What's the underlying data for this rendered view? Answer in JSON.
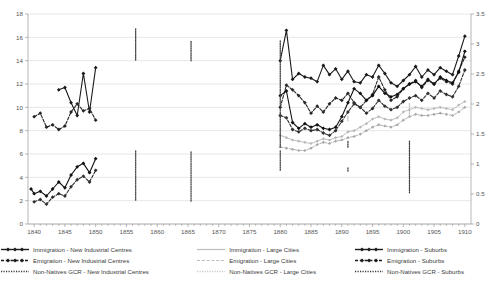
{
  "chart_data": {
    "type": "line",
    "title": "",
    "subtitle": "",
    "xlabel": "",
    "ylabel": "",
    "y2label": "",
    "xlim": [
      1839,
      1911
    ],
    "ylim": [
      0,
      18
    ],
    "y2lim": [
      0,
      3.5
    ],
    "grid": true,
    "legend_position": "bottom",
    "x_ticks": [
      1840,
      1845,
      1850,
      1855,
      1860,
      1865,
      1870,
      1875,
      1880,
      1885,
      1890,
      1895,
      1900,
      1905,
      1910
    ],
    "y_ticks": [
      0,
      2,
      4,
      6,
      8,
      10,
      12,
      14,
      16,
      18
    ],
    "y2_ticks": [
      0,
      0.5,
      1,
      1.5,
      2,
      2.5,
      3,
      3.5
    ],
    "series": [
      {
        "name": "Immigration - New Industrial Centres",
        "axis": "left",
        "style": "solid-marker",
        "color": "#1a1a1a",
        "points": [
          [
            1844,
            11.5
          ],
          [
            1845,
            11.7
          ],
          [
            1846,
            10.4
          ],
          [
            1847,
            9.3
          ],
          [
            1848,
            12.9
          ],
          [
            1849,
            9.6
          ],
          [
            1850,
            13.4
          ],
          [
            1880,
            14.0
          ],
          [
            1881,
            16.6
          ],
          [
            1882,
            12.4
          ],
          [
            1883,
            12.9
          ],
          [
            1884,
            12.6
          ],
          [
            1885,
            12.5
          ],
          [
            1886,
            12.2
          ],
          [
            1887,
            13.6
          ],
          [
            1888,
            12.8
          ],
          [
            1889,
            13.3
          ],
          [
            1890,
            12.4
          ],
          [
            1891,
            13.1
          ],
          [
            1892,
            12.2
          ],
          [
            1893,
            12.1
          ],
          [
            1894,
            12.8
          ],
          [
            1895,
            12.6
          ],
          [
            1896,
            13.6
          ],
          [
            1897,
            12.9
          ],
          [
            1898,
            12.1
          ],
          [
            1899,
            11.8
          ],
          [
            1900,
            12.3
          ],
          [
            1901,
            12.8
          ],
          [
            1902,
            13.5
          ],
          [
            1903,
            12.6
          ],
          [
            1904,
            13.2
          ],
          [
            1905,
            12.8
          ],
          [
            1906,
            13.4
          ],
          [
            1907,
            13.1
          ],
          [
            1908,
            12.8
          ],
          [
            1909,
            14.4
          ],
          [
            1910,
            16.1
          ]
        ]
      },
      {
        "name": "Emigration - New Industrial Centres",
        "axis": "left",
        "style": "dashed-marker",
        "color": "#262626",
        "points": [
          [
            1840,
            9.2
          ],
          [
            1841,
            9.5
          ],
          [
            1842,
            8.3
          ],
          [
            1843,
            8.5
          ],
          [
            1844,
            8.1
          ],
          [
            1845,
            8.4
          ],
          [
            1846,
            9.6
          ],
          [
            1847,
            10.3
          ],
          [
            1848,
            9.7
          ],
          [
            1849,
            9.9
          ],
          [
            1850,
            8.9
          ],
          [
            1880,
            10.0
          ],
          [
            1881,
            11.9
          ],
          [
            1882,
            11.5
          ],
          [
            1883,
            11.0
          ],
          [
            1884,
            10.4
          ],
          [
            1885,
            9.5
          ],
          [
            1886,
            10.1
          ],
          [
            1887,
            9.6
          ],
          [
            1888,
            10.3
          ],
          [
            1889,
            10.8
          ],
          [
            1890,
            10.6
          ],
          [
            1891,
            11.2
          ],
          [
            1892,
            10.4
          ],
          [
            1893,
            10.0
          ],
          [
            1894,
            10.6
          ],
          [
            1895,
            11.1
          ],
          [
            1896,
            12.6
          ],
          [
            1897,
            11.5
          ],
          [
            1898,
            10.6
          ],
          [
            1899,
            10.9
          ],
          [
            1900,
            11.6
          ],
          [
            1901,
            12.0
          ],
          [
            1902,
            12.3
          ],
          [
            1903,
            11.7
          ],
          [
            1904,
            12.3
          ],
          [
            1905,
            12.0
          ],
          [
            1906,
            12.5
          ],
          [
            1907,
            12.2
          ],
          [
            1908,
            12.0
          ],
          [
            1909,
            13.1
          ],
          [
            1910,
            14.3
          ]
        ]
      },
      {
        "name": "Immigration - Large Cities",
        "axis": "left",
        "style": "solid-light",
        "color": "#b8b8b8",
        "points": [
          [
            1880,
            7.6
          ],
          [
            1881,
            7.4
          ],
          [
            1882,
            7.2
          ],
          [
            1883,
            7.1
          ],
          [
            1884,
            7.0
          ],
          [
            1885,
            6.9
          ],
          [
            1886,
            7.1
          ],
          [
            1887,
            7.3
          ],
          [
            1888,
            7.2
          ],
          [
            1889,
            7.4
          ],
          [
            1890,
            7.5
          ],
          [
            1891,
            7.9
          ],
          [
            1892,
            8.0
          ],
          [
            1893,
            8.3
          ],
          [
            1894,
            8.6
          ],
          [
            1895,
            9.0
          ],
          [
            1896,
            9.2
          ],
          [
            1897,
            9.0
          ],
          [
            1898,
            8.9
          ],
          [
            1899,
            9.1
          ],
          [
            1900,
            9.6
          ],
          [
            1901,
            9.8
          ],
          [
            1902,
            10.0
          ],
          [
            1903,
            9.9
          ],
          [
            1904,
            9.8
          ],
          [
            1905,
            9.9
          ],
          [
            1906,
            10.0
          ],
          [
            1907,
            9.9
          ],
          [
            1908,
            9.8
          ],
          [
            1909,
            10.2
          ],
          [
            1910,
            10.5
          ]
        ]
      },
      {
        "name": "Emigration - Large Cities",
        "axis": "left",
        "style": "dashed-light",
        "color": "#a8a8a8",
        "points": [
          [
            1880,
            6.6
          ],
          [
            1881,
            6.5
          ],
          [
            1882,
            6.4
          ],
          [
            1883,
            6.3
          ],
          [
            1884,
            6.3
          ],
          [
            1885,
            6.5
          ],
          [
            1886,
            6.8
          ],
          [
            1887,
            7.0
          ],
          [
            1888,
            6.9
          ],
          [
            1889,
            7.1
          ],
          [
            1890,
            7.2
          ],
          [
            1891,
            7.4
          ],
          [
            1892,
            7.5
          ],
          [
            1893,
            7.7
          ],
          [
            1894,
            8.0
          ],
          [
            1895,
            8.3
          ],
          [
            1896,
            8.5
          ],
          [
            1897,
            8.4
          ],
          [
            1898,
            8.3
          ],
          [
            1899,
            8.5
          ],
          [
            1900,
            8.9
          ],
          [
            1901,
            9.2
          ],
          [
            1902,
            9.4
          ],
          [
            1903,
            9.3
          ],
          [
            1904,
            9.3
          ],
          [
            1905,
            9.4
          ],
          [
            1906,
            9.5
          ],
          [
            1907,
            9.4
          ],
          [
            1908,
            9.3
          ],
          [
            1909,
            9.6
          ],
          [
            1910,
            10.0
          ]
        ]
      },
      {
        "name": "Immigration - Suburbs",
        "axis": "left",
        "style": "solid-marker",
        "color": "#111111",
        "points": [
          [
            1839.5,
            3.0
          ],
          [
            1840,
            2.6
          ],
          [
            1841,
            2.8
          ],
          [
            1842,
            2.4
          ],
          [
            1843,
            3.0
          ],
          [
            1844,
            3.6
          ],
          [
            1845,
            3.1
          ],
          [
            1846,
            4.2
          ],
          [
            1847,
            4.9
          ],
          [
            1848,
            5.2
          ],
          [
            1849,
            4.4
          ],
          [
            1850,
            5.6
          ],
          [
            1880,
            11.0
          ],
          [
            1881,
            11.4
          ],
          [
            1882,
            8.7
          ],
          [
            1883,
            8.2
          ],
          [
            1884,
            8.6
          ],
          [
            1885,
            8.3
          ],
          [
            1886,
            8.5
          ],
          [
            1887,
            8.2
          ],
          [
            1888,
            8.1
          ],
          [
            1889,
            8.3
          ],
          [
            1890,
            9.2
          ],
          [
            1891,
            10.4
          ],
          [
            1892,
            11.6
          ],
          [
            1893,
            11.2
          ],
          [
            1894,
            10.6
          ],
          [
            1895,
            11.0
          ],
          [
            1896,
            11.8
          ],
          [
            1897,
            11.2
          ],
          [
            1898,
            10.9
          ],
          [
            1899,
            11.1
          ],
          [
            1900,
            11.6
          ],
          [
            1901,
            12.0
          ],
          [
            1902,
            12.2
          ],
          [
            1903,
            11.8
          ],
          [
            1904,
            12.4
          ],
          [
            1905,
            12.0
          ],
          [
            1906,
            12.6
          ],
          [
            1907,
            12.3
          ],
          [
            1908,
            12.1
          ],
          [
            1909,
            13.0
          ],
          [
            1910,
            14.8
          ]
        ]
      },
      {
        "name": "Emigration - Suburbs",
        "axis": "left",
        "style": "dashed-marker",
        "color": "#303030",
        "points": [
          [
            1840,
            1.9
          ],
          [
            1841,
            2.1
          ],
          [
            1842,
            1.7
          ],
          [
            1843,
            2.3
          ],
          [
            1844,
            2.6
          ],
          [
            1845,
            2.4
          ],
          [
            1846,
            3.2
          ],
          [
            1847,
            3.8
          ],
          [
            1848,
            4.1
          ],
          [
            1849,
            3.6
          ],
          [
            1850,
            4.6
          ],
          [
            1880,
            9.3
          ],
          [
            1881,
            9.1
          ],
          [
            1882,
            8.1
          ],
          [
            1883,
            7.9
          ],
          [
            1884,
            8.2
          ],
          [
            1885,
            8.0
          ],
          [
            1886,
            8.1
          ],
          [
            1887,
            7.8
          ],
          [
            1888,
            7.6
          ],
          [
            1889,
            8.0
          ],
          [
            1890,
            8.8
          ],
          [
            1891,
            9.6
          ],
          [
            1892,
            10.3
          ],
          [
            1893,
            10.0
          ],
          [
            1894,
            9.5
          ],
          [
            1895,
            9.9
          ],
          [
            1896,
            10.6
          ],
          [
            1897,
            10.1
          ],
          [
            1898,
            9.8
          ],
          [
            1899,
            10.0
          ],
          [
            1900,
            10.5
          ],
          [
            1901,
            10.8
          ],
          [
            1902,
            11.0
          ],
          [
            1903,
            10.6
          ],
          [
            1904,
            11.2
          ],
          [
            1905,
            10.8
          ],
          [
            1906,
            11.4
          ],
          [
            1907,
            11.1
          ],
          [
            1908,
            10.9
          ],
          [
            1909,
            11.8
          ],
          [
            1910,
            13.2
          ]
        ]
      },
      {
        "name": "Non-Natives GCR - New Industrial Centres",
        "axis": "right",
        "style": "dotted-step",
        "color": "#404040",
        "points": [
          [
            1844,
            3.25
          ],
          [
            1856.5,
            3.25
          ],
          [
            1856.5,
            2.72
          ],
          [
            1865.5,
            2.72
          ],
          [
            1865.5,
            3.05
          ],
          [
            1880,
            3.05
          ],
          [
            1880,
            1.28
          ],
          [
            1891,
            1.28
          ],
          [
            1891,
            1.38
          ],
          [
            1901,
            1.38
          ],
          [
            1901,
            0.52
          ],
          [
            1910.5,
            0.52
          ]
        ]
      },
      {
        "name": "Non-Natives GCR - Large Cities",
        "axis": "right",
        "style": "dotted-step-light",
        "color": "#c2c2c2",
        "points": [
          [
            1880,
            1.72
          ],
          [
            1891,
            1.72
          ],
          [
            1891,
            1.8
          ],
          [
            1901,
            1.8
          ],
          [
            1901,
            2.02
          ],
          [
            1910.5,
            2.02
          ]
        ]
      },
      {
        "name": "Non-Natives GCR - Suburbs",
        "axis": "right",
        "style": "dotted-step",
        "color": "#4a4a4a",
        "points": [
          [
            1846,
            1.22
          ],
          [
            1856.5,
            1.22
          ],
          [
            1856.5,
            0.38
          ],
          [
            1865.5,
            0.38
          ],
          [
            1865.5,
            1.22
          ],
          [
            1880,
            1.22
          ],
          [
            1880,
            0.88
          ],
          [
            1891,
            0.88
          ],
          [
            1891,
            0.95
          ],
          [
            1901,
            0.95
          ],
          [
            1901,
            0.9
          ],
          [
            1910.5,
            0.9
          ]
        ]
      }
    ]
  },
  "legend": {
    "entries": [
      {
        "label": "Immigration - New Industrial Centres",
        "swatch": "solid-marker-dark"
      },
      {
        "label": "Immigration - Large Cities",
        "swatch": "solid-light"
      },
      {
        "label": "Immigration - Suburbs",
        "swatch": "solid-marker-dark"
      },
      {
        "label": "Emigration - New Industrial Centres",
        "swatch": "dashed-marker-dark"
      },
      {
        "label": "Emigration - Large Cities",
        "swatch": "dashed-light"
      },
      {
        "label": "Emigration - Suburbs",
        "swatch": "dashed-marker-dark"
      },
      {
        "label": "Non-Natives GCR - New Industrial Centres",
        "swatch": "dotted-dark"
      },
      {
        "label": "Non-Natives GCR - Large Cities",
        "swatch": "dotted-light"
      },
      {
        "label": "Non-Natives GCR - Suburbs",
        "swatch": "dotted-dark"
      }
    ]
  },
  "colors": {
    "grid": "#d6d6d6",
    "axis": "#9a9a9a",
    "dark_series": "#1a1a1a",
    "light_series": "#b8b8b8",
    "text": "#565656"
  }
}
